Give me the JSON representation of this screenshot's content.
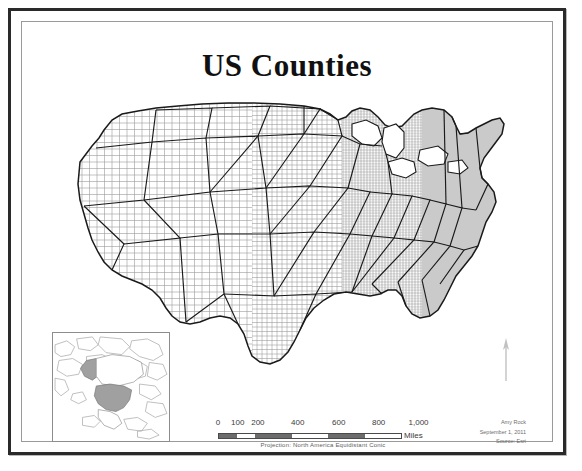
{
  "poster": {
    "title": "US Counties",
    "background_color": "#ffffff",
    "frame_color": "#2a2a2a",
    "inner_frame_color": "#9a9a9a"
  },
  "main_map": {
    "name": "us-counties-map",
    "description": "Contiguous United States with county boundaries",
    "county_line_color": "#8c8c8c",
    "state_line_color": "#1a1a1a",
    "fill_color": "#ffffff"
  },
  "inset_map": {
    "name": "north-america-locator",
    "description": "North America locator map with United States highlighted",
    "highlight_color": "#a8a8a8",
    "outline_color": "#9b9b9b"
  },
  "north_arrow": {
    "label": "N"
  },
  "scale_bar": {
    "ticks": [
      "0",
      "100",
      "200",
      "400",
      "600",
      "800",
      "1,000"
    ],
    "tick_positions": [
      0,
      10,
      20,
      40,
      60,
      80,
      100
    ],
    "units_label": "Miles",
    "segments": [
      "dark",
      "light",
      "dark",
      "light",
      "dark",
      "light"
    ],
    "projection_note": "Projection: North America Equidistant Conic"
  },
  "credits": {
    "author": "Amy Rock",
    "date": "September 1, 2011",
    "source": "Source: Esri"
  }
}
